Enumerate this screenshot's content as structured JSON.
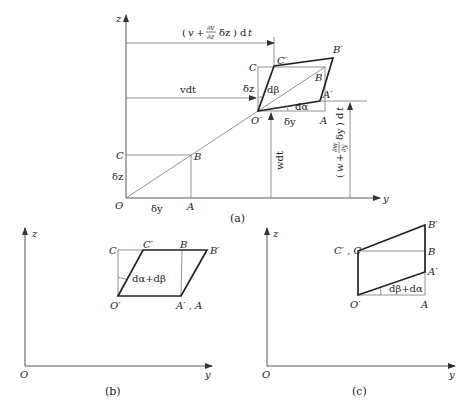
{
  "figure_a": {
    "caption": "(a)",
    "axis_z": "z",
    "axis_y": "y",
    "origin": "O",
    "points": {
      "C": "C",
      "B": "B",
      "A": "A",
      "O_prime": "O′",
      "A_prime": "A′",
      "B_prime": "B′",
      "C_prime": "C′",
      "C_upper": "C",
      "B_upper": "B",
      "A_upper": "A"
    },
    "dims": {
      "dz_lower": "δz",
      "dy_lower": "δy",
      "dz_upper": "δz",
      "dy_upper": "δy",
      "vdt": "vdt",
      "wdt": "wdt",
      "v_top": "(v + ∂v/∂z δz) dt",
      "w_right": "(w + ∂w/∂y δy) dt",
      "dbeta": "dβ",
      "dalpha": "dα"
    }
  },
  "figure_b": {
    "caption": "(b)",
    "axis_z": "z",
    "axis_y": "y",
    "origin": "O",
    "points": {
      "C": "C",
      "C_prime": "C′",
      "B": "B",
      "B_prime": "B′",
      "O_prime": "O′",
      "A_prime_A": "A′ , A"
    },
    "angle": "dα+dβ"
  },
  "figure_c": {
    "caption": "(c)",
    "axis_z": "z",
    "axis_y": "y",
    "origin": "O",
    "points": {
      "C_prime_C": "C′ , C",
      "B_prime": "B′",
      "B": "B",
      "A_prime": "A′",
      "O_prime": "O′",
      "A": "A"
    },
    "angle": "dβ+dα"
  }
}
